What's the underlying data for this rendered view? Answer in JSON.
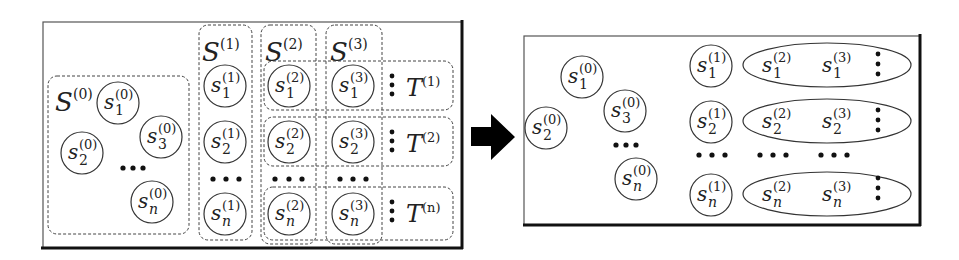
{
  "diagram": {
    "type": "set-transformation",
    "left_panel": {
      "groups": {
        "s0": {
          "label": "S",
          "superscript": "(0)"
        },
        "s1": {
          "label": "S",
          "superscript": "(1)"
        },
        "s2": {
          "label": "S",
          "superscript": "(2)"
        },
        "s3": {
          "label": "S",
          "superscript": "(3)"
        }
      },
      "tuples": [
        {
          "label": "T",
          "superscript": "(1)"
        },
        {
          "label": "T",
          "superscript": "(2)"
        },
        {
          "label": "T",
          "superscript": "(n)"
        }
      ],
      "set0_nodes": [
        {
          "base": "s",
          "sub": "1",
          "sup": "(0)"
        },
        {
          "base": "s",
          "sub": "3",
          "sup": "(0)"
        },
        {
          "base": "s",
          "sub": "2",
          "sup": "(0)"
        },
        {
          "base": "s",
          "sub": "n",
          "sup": "(0)"
        }
      ],
      "col1_nodes": [
        {
          "base": "s",
          "sub": "1",
          "sup": "(1)"
        },
        {
          "base": "s",
          "sub": "2",
          "sup": "(1)"
        },
        {
          "base": "s",
          "sub": "n",
          "sup": "(1)"
        }
      ],
      "col2_nodes": [
        {
          "base": "s",
          "sub": "1",
          "sup": "(2)"
        },
        {
          "base": "s",
          "sub": "2",
          "sup": "(2)"
        },
        {
          "base": "s",
          "sub": "n",
          "sup": "(2)"
        }
      ],
      "col3_nodes": [
        {
          "base": "s",
          "sub": "1",
          "sup": "(3)"
        },
        {
          "base": "s",
          "sub": "2",
          "sup": "(3)"
        },
        {
          "base": "s",
          "sub": "n",
          "sup": "(3)"
        }
      ],
      "ellipsis": "•••",
      "vertical_ellipsis": "⋮"
    },
    "arrow": {
      "direction": "right",
      "color": "#000000"
    },
    "right_panel": {
      "set0_nodes": [
        {
          "base": "s",
          "sub": "1",
          "sup": "(0)"
        },
        {
          "base": "s",
          "sub": "3",
          "sup": "(0)"
        },
        {
          "base": "s",
          "sub": "2",
          "sup": "(0)"
        },
        {
          "base": "s",
          "sub": "n",
          "sup": "(0)"
        }
      ],
      "rows": [
        {
          "lead": {
            "base": "s",
            "sub": "1",
            "sup": "(1)"
          },
          "items": [
            {
              "base": "s",
              "sub": "1",
              "sup": "(2)"
            },
            {
              "base": "s",
              "sub": "1",
              "sup": "(3)"
            }
          ]
        },
        {
          "lead": {
            "base": "s",
            "sub": "2",
            "sup": "(1)"
          },
          "items": [
            {
              "base": "s",
              "sub": "2",
              "sup": "(2)"
            },
            {
              "base": "s",
              "sub": "2",
              "sup": "(3)"
            }
          ]
        },
        {
          "lead": {
            "base": "s",
            "sub": "n",
            "sup": "(1)"
          },
          "items": [
            {
              "base": "s",
              "sub": "n",
              "sup": "(2)"
            },
            {
              "base": "s",
              "sub": "n",
              "sup": "(3)"
            }
          ]
        }
      ]
    },
    "colors": {
      "stroke": "#333333",
      "panel_border": "#222222",
      "background": "#ffffff"
    }
  }
}
